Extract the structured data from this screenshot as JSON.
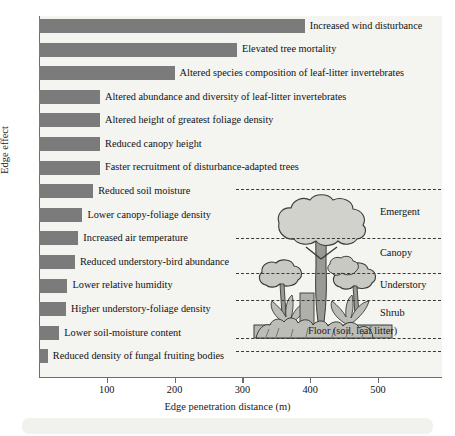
{
  "chart_data": {
    "type": "bar",
    "orientation": "horizontal",
    "title": "",
    "xlabel": "Edge penetration distance (m)",
    "ylabel": "Edge effect",
    "xlim": [
      0,
      570
    ],
    "xticks": [
      100,
      200,
      300,
      400,
      500
    ],
    "xtick_labels": [
      "100",
      "200",
      "300",
      "400",
      "500"
    ],
    "grid": false,
    "legend": "none",
    "bar_color": "#7b7b7b",
    "plot_background": "#f4f4f1",
    "categories": [
      "Increased wind disturbance",
      "Elevated tree mortality",
      "Altered species composition of leaf-litter invertebrates",
      "Altered abundance and diversity of leaf-litter invertebrates",
      "Altered height of greatest foliage density",
      "Reduced canopy height",
      "Faster recruitment of disturbance-adapted trees",
      "Reduced soil moisture",
      "Lower canopy-foliage density",
      "Increased air temperature",
      "Reduced understory-bird abundance",
      "Lower relative humidity",
      "Higher understory-foliage density",
      "Lower soil-moisture content",
      "Reduced density of fungal fruiting bodies"
    ],
    "values": [
      392,
      292,
      200,
      90,
      90,
      90,
      90,
      80,
      64,
      58,
      53,
      42,
      40,
      30,
      13
    ]
  },
  "inset": {
    "name": "rainforest-vertical-structure",
    "layers": [
      {
        "label": "Emergent"
      },
      {
        "label": "Canopy"
      },
      {
        "label": "Understory"
      },
      {
        "label": "Shrub"
      }
    ],
    "floor_label": "Floor (soil, leaf litter)",
    "foliage_color": "#c9c9c4",
    "trunk_color": "#9a9a95",
    "outline_color": "#3a3a3a"
  }
}
